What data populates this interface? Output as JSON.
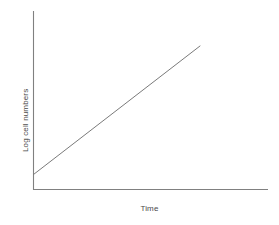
{
  "figure": {
    "background_color": "#ffffff",
    "width": 279,
    "height": 225
  },
  "chart_data": {
    "type": "line",
    "title": "",
    "subtitle": "",
    "xlabel": "Time",
    "ylabel": "Log cell numbers",
    "grid": false,
    "legend": null,
    "legend_position": "none",
    "xlim": [
      0,
      1
    ],
    "ylim": [
      0,
      1
    ],
    "xticks": [],
    "yticks": [],
    "xticklabels": [],
    "yticklabels": [],
    "series": [
      {
        "name": "Log cell numbers",
        "line_color": "#7a7a7a",
        "line_width": 1,
        "x": [
          0.0,
          1.0
        ],
        "y": [
          0.085,
          0.803
        ],
        "points": [
          {
            "x": 0.0,
            "y": 0.085
          },
          {
            "x": 1.0,
            "y": 0.803
          }
        ]
      }
    ],
    "axes": {
      "color": "#808080",
      "line_width": 1,
      "spines": {
        "left": true,
        "bottom": true,
        "top": false,
        "right": false
      }
    }
  },
  "labels": {
    "y_axis": "Log cell numbers",
    "x_axis": "Time"
  },
  "colors": {
    "axis": "#808080",
    "data_line": "#7a7a7a",
    "text": "#4a4a4a",
    "background": "#ffffff"
  }
}
